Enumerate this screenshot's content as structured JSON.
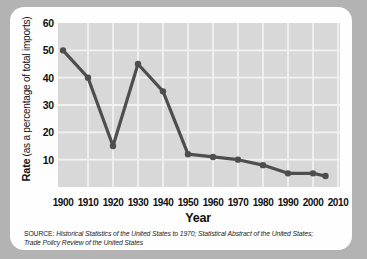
{
  "colors": {
    "page_bg": "#b3b3b3",
    "card_bg": "#fefefe",
    "plot_bg": "#d8d8d8",
    "grid": "#f1f1f1",
    "line": "#4e4e4e",
    "text": "#111111"
  },
  "chart_data": {
    "type": "line",
    "title": "",
    "xlabel": "Year",
    "ylabel": {
      "bold": "Rate",
      "rest": "(as a percentage of total imports)"
    },
    "x": [
      1900,
      1910,
      1920,
      1930,
      1940,
      1950,
      1960,
      1970,
      1980,
      1990,
      2000,
      2005
    ],
    "values": [
      50,
      40,
      15,
      45,
      35,
      12,
      11,
      10,
      8,
      5,
      5,
      4
    ],
    "x_ticks": [
      1900,
      1910,
      1920,
      1930,
      1940,
      1950,
      1960,
      1970,
      1980,
      1990,
      2000,
      2010
    ],
    "y_ticks": [
      10,
      20,
      30,
      40,
      50,
      60
    ],
    "xlim": [
      1900,
      2010
    ],
    "ylim": [
      0,
      60
    ],
    "grid": true,
    "legend": false,
    "markers": true
  },
  "source": {
    "prefix": "SOURCE:",
    "line1": "Historical Statistics of the United States to 1970; Statistical Abstract of the United States;",
    "line2": "Trade Policy Review of the United States"
  }
}
